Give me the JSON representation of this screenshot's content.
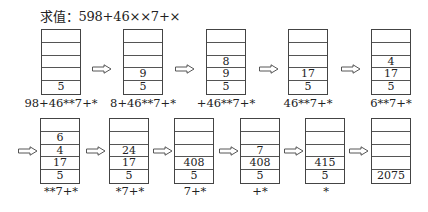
{
  "title": "求值：598+46××7+×",
  "row1": [
    {
      "cells": [
        "",
        "",
        "",
        "",
        "5"
      ],
      "label": "98+46**7+*"
    },
    {
      "cells": [
        "",
        "",
        "",
        "9",
        "5"
      ],
      "label": "8+46**7+*"
    },
    {
      "cells": [
        "",
        "",
        "8",
        "9",
        "5"
      ],
      "label": "+46**7+*"
    },
    {
      "cells": [
        "",
        "",
        "",
        "17",
        "5"
      ],
      "label": "46**7+*"
    },
    {
      "cells": [
        "",
        "",
        "4",
        "17",
        "5"
      ],
      "label": "6**7+*"
    }
  ],
  "row2": [
    {
      "cells": [
        "",
        "6",
        "4",
        "17",
        "5"
      ],
      "label": "**7+*"
    },
    {
      "cells": [
        "",
        "",
        "24",
        "17",
        "5"
      ],
      "label": "*7+*"
    },
    {
      "cells": [
        "",
        "",
        "",
        "408",
        "5"
      ],
      "label": "7+*"
    },
    {
      "cells": [
        "",
        "",
        "7",
        "408",
        "5"
      ],
      "label": "+*"
    },
    {
      "cells": [
        "",
        "",
        "",
        "415",
        "5"
      ],
      "label": "*"
    },
    {
      "cells": [
        "",
        "",
        "",
        "",
        "2075"
      ],
      "label": ""
    }
  ],
  "arrow_icon": "hollow-right-arrow"
}
